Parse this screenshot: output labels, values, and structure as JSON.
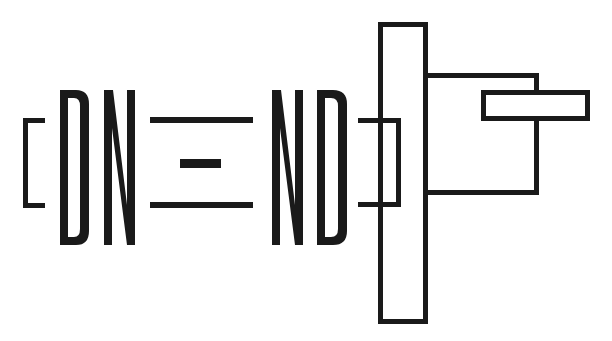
{
  "diagram": {
    "colors": {
      "stroke": "#1a1a1a",
      "background": "#ffffff"
    },
    "letters": {
      "left_pair": [
        "D",
        "N"
      ],
      "right_pair": [
        "N",
        "D"
      ]
    },
    "elements": [
      {
        "name": "left-bracket",
        "type": "bracket-open"
      },
      {
        "name": "letter-D-left",
        "type": "letter",
        "text": "D"
      },
      {
        "name": "letter-N-left",
        "type": "letter",
        "text": "N"
      },
      {
        "name": "equals-top-line",
        "type": "line"
      },
      {
        "name": "center-dash",
        "type": "bar"
      },
      {
        "name": "equals-bottom-line",
        "type": "line"
      },
      {
        "name": "letter-N-right",
        "type": "letter",
        "text": "N"
      },
      {
        "name": "letter-D-right",
        "type": "letter",
        "text": "D"
      },
      {
        "name": "right-bracket",
        "type": "bracket-close"
      },
      {
        "name": "tall-flange",
        "type": "rectangle"
      },
      {
        "name": "c-arm",
        "type": "polyline"
      },
      {
        "name": "horizontal-bar",
        "type": "rectangle"
      }
    ]
  }
}
